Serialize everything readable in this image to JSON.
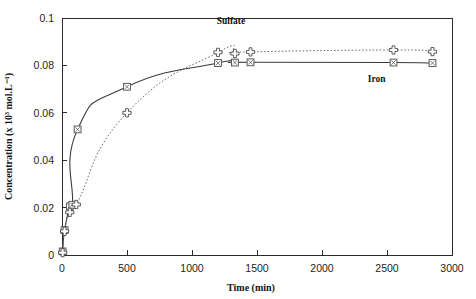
{
  "chart_data": {
    "type": "line",
    "title": "",
    "xlabel": "Time (min)",
    "ylabel": "Concentration (x 10³ mol.L⁻¹)",
    "xlim": [
      0,
      3000
    ],
    "ylim": [
      0,
      0.1
    ],
    "xticks": [
      0,
      500,
      1000,
      1500,
      2000,
      2500,
      3000
    ],
    "xtick_labels": [
      "0",
      "500",
      "1000",
      "1500",
      "2000",
      "2500",
      "3000"
    ],
    "yticks": [
      0,
      0.02,
      0.04,
      0.06,
      0.08,
      0.1
    ],
    "ytick_labels": [
      "0",
      "0.02",
      "0.04",
      "0.06",
      "0.08",
      "0.1"
    ],
    "grid": false,
    "legend_position": "inline-annotations",
    "series": [
      {
        "name": "Iron",
        "marker": "square-with-x",
        "line_style": "solid",
        "label_annotation": "Iron",
        "points": [
          {
            "x": 5,
            "y": 0.0015
          },
          {
            "x": 20,
            "y": 0.0105
          },
          {
            "x": 60,
            "y": 0.0205
          },
          {
            "x": 80,
            "y": 0.0212
          },
          {
            "x": 120,
            "y": 0.053
          },
          {
            "x": 500,
            "y": 0.071
          },
          {
            "x": 1200,
            "y": 0.081
          },
          {
            "x": 1330,
            "y": 0.0812
          },
          {
            "x": 1450,
            "y": 0.0813
          },
          {
            "x": 2550,
            "y": 0.0812
          },
          {
            "x": 2850,
            "y": 0.081
          }
        ]
      },
      {
        "name": "Sulfate",
        "marker": "plus-cross",
        "line_style": "dotted",
        "label_annotation": "Sulfate",
        "points": [
          {
            "x": 5,
            "y": 0.001
          },
          {
            "x": 20,
            "y": 0.01
          },
          {
            "x": 60,
            "y": 0.018
          },
          {
            "x": 110,
            "y": 0.0213
          },
          {
            "x": 500,
            "y": 0.06
          },
          {
            "x": 1200,
            "y": 0.0855
          },
          {
            "x": 1330,
            "y": 0.085
          },
          {
            "x": 1450,
            "y": 0.0857
          },
          {
            "x": 2550,
            "y": 0.0865
          },
          {
            "x": 2850,
            "y": 0.0858
          }
        ]
      }
    ],
    "annotations": [
      {
        "text": "Sulfate",
        "x": 1300,
        "y": 0.0975
      },
      {
        "text": "Iron",
        "x": 2420,
        "y": 0.073
      }
    ]
  }
}
